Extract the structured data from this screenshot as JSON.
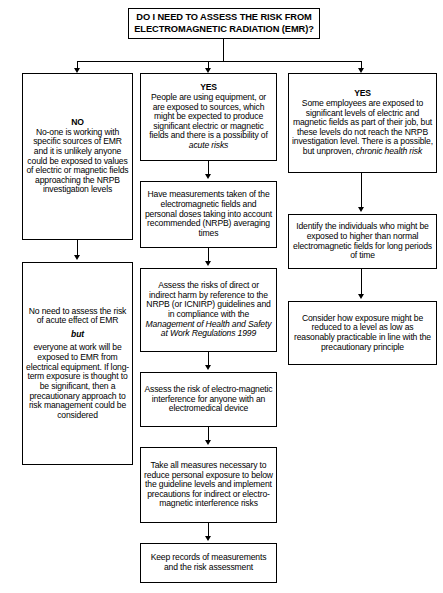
{
  "title": {
    "line1": "DO I NEED TO ASSESS THE RISK FROM",
    "line2": "ELECTROMAGNETIC RADIATION (EMR)?"
  },
  "columns": {
    "left": {
      "answer": "NO",
      "boxes": [
        {
          "id": "left-no-box",
          "heading": "NO",
          "body": "No-one is working with specific sources of EMR and it is unlikely anyone could be exposed to values of electric or magnetic fields approaching the NRPB investigation levels"
        },
        {
          "id": "left-no-need-box",
          "part1": "No need to assess the risk of acute effect of EMR",
          "emphasis": "but",
          "part2": "everyone at work will be exposed to EMR from electrical equipment. If long-term exposure is thought to be significant, then a precautionary approach to risk management could be considered"
        }
      ]
    },
    "middle": {
      "answer": "YES",
      "boxes": [
        {
          "id": "mid-yes-box",
          "heading": "YES",
          "part1": "People are using equipment, or are exposed to sources, which might be expected to produce significant electric or magnetic fields and there is a possibility of ",
          "emphasis": "acute risks"
        },
        {
          "id": "mid-measurements-box",
          "body": "Have measurements taken of the electromagnetic fields and personal doses taking into account recommended (NRPB) averaging times"
        },
        {
          "id": "mid-assess-risks-box",
          "part1": "Assess the risks of direct or indirect harm by reference to the NRPB (or ICNIRP) guidelines and in compliance with the ",
          "emphasis": "Management of Health and Safety at Work Regulations 1999"
        },
        {
          "id": "mid-interference-box",
          "body": "Assess the risk of electro-magnetic interference for anyone with an electromedical device"
        },
        {
          "id": "mid-measures-box",
          "body": "Take all measures necessary to reduce personal exposure to below the guideline levels and implement precautions for indirect or electro-magnetic interference risks"
        },
        {
          "id": "mid-records-box",
          "body": "Keep records of measurements and the risk assessment"
        }
      ]
    },
    "right": {
      "answer": "YES",
      "boxes": [
        {
          "id": "right-yes-box",
          "heading": "YES",
          "part1": "Some employees are exposed to significant levels of electric and magnetic fields as part of their job, but these levels do not reach the NRPB investigation level. There is a possible, but unproven, ",
          "emphasis": "chronic health risk"
        },
        {
          "id": "right-identify-box",
          "body": "Identify the individuals who might be exposed to higher than normal electromagnetic fields for long periods of time"
        },
        {
          "id": "right-consider-box",
          "body": "Consider how exposure might be reduced to a level as low as reasonably practicable in line with the precautionary principle"
        }
      ]
    }
  }
}
